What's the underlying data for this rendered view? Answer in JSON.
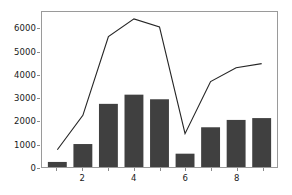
{
  "chart_data": {
    "type": "bar",
    "title": "",
    "xlabel": "",
    "ylabel": "",
    "x": [
      1,
      2,
      3,
      4,
      5,
      6,
      7,
      8,
      9
    ],
    "categories": [
      "1",
      "2",
      "3",
      "4",
      "5",
      "6",
      "7",
      "8",
      "9"
    ],
    "series": [
      {
        "name": "bars",
        "type": "bar",
        "color": "#404040",
        "values": [
          220,
          1000,
          2750,
          3150,
          2950,
          580,
          1730,
          2050,
          2130
        ]
      },
      {
        "name": "line",
        "type": "line",
        "color": "#262626",
        "values": [
          750,
          2250,
          5680,
          6450,
          6100,
          1450,
          3720,
          4320,
          4500
        ]
      }
    ],
    "xlim": [
      0.4,
      9.6
    ],
    "ylim": [
      0,
      6750
    ],
    "yticks": [
      0,
      1000,
      2000,
      3000,
      4000,
      5000,
      6000
    ],
    "ytick_labels": [
      "0",
      "1000",
      "2000",
      "3000",
      "4000",
      "5000",
      "6000"
    ],
    "xticks": [
      2,
      4,
      6,
      8
    ],
    "xtick_labels": [
      "2",
      "4",
      "6",
      "8"
    ],
    "xticks_minor": [
      1,
      3,
      5,
      7,
      9
    ],
    "grid": false,
    "legend": null,
    "frame_color": "#9a9a9a",
    "background": "#ffffff"
  }
}
